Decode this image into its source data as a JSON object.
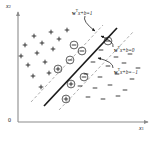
{
  "figure": {
    "background_color": "#ffffff",
    "ink_color": "#1a1a1a",
    "dashed_color": "#9a9a9a",
    "axis_color": "#8c8c8c"
  },
  "axes": {
    "x_label": "x",
    "x_subscript": "1",
    "y_label": "x",
    "y_subscript": "2",
    "origin_label": "0"
  },
  "annotations": [
    {
      "id": "margin-upper",
      "text_prefix": "w",
      "text_sup": "T",
      "text_suffix": "x+b=1",
      "x": 72,
      "y": 10
    },
    {
      "id": "hyperplane",
      "text_prefix": "w",
      "text_sup": "T",
      "text_suffix": "x+b=0",
      "x": 114,
      "y": 47
    },
    {
      "id": "margin-lower",
      "text_prefix": "w",
      "text_sup": "T",
      "text_suffix": "x+b=−1",
      "x": 114,
      "y": 69
    }
  ],
  "chart_data": {
    "type": "scatter",
    "xlabel": "x1",
    "ylabel": "x2",
    "xlim": [
      0,
      165
    ],
    "ylim": [
      0,
      141
    ],
    "grid": false,
    "legend": null,
    "lines": [
      {
        "name": "decision-boundary",
        "equation": "wTx+b=0",
        "style": "solid",
        "x1": 44,
        "y1": 106,
        "x2": 117,
        "y2": 28
      },
      {
        "name": "upper-margin",
        "equation": "wTx+b=1",
        "style": "dashed",
        "x1": 59,
        "y1": 110,
        "x2": 134,
        "y2": 31
      },
      {
        "name": "lower-margin",
        "equation": "wTx+b=-1",
        "style": "dashed",
        "x1": 31,
        "y1": 102,
        "x2": 103,
        "y2": 25
      }
    ],
    "series": [
      {
        "name": "positive-class",
        "marker": "plus",
        "points": [
          {
            "x": 34,
            "y": 36,
            "support": false
          },
          {
            "x": 51,
            "y": 32,
            "support": false
          },
          {
            "x": 67,
            "y": 30,
            "support": false
          },
          {
            "x": 25,
            "y": 45,
            "support": false
          },
          {
            "x": 42,
            "y": 43,
            "support": false
          },
          {
            "x": 59,
            "y": 39,
            "support": false
          },
          {
            "x": 21,
            "y": 56,
            "support": false
          },
          {
            "x": 37,
            "y": 53,
            "support": false
          },
          {
            "x": 53,
            "y": 49,
            "support": false
          },
          {
            "x": 28,
            "y": 65,
            "support": false
          },
          {
            "x": 45,
            "y": 62,
            "support": false
          },
          {
            "x": 33,
            "y": 76,
            "support": false
          },
          {
            "x": 49,
            "y": 73,
            "support": false
          },
          {
            "x": 41,
            "y": 87,
            "support": false
          },
          {
            "x": 58,
            "y": 69,
            "support": true
          },
          {
            "x": 71,
            "y": 84,
            "support": true
          },
          {
            "x": 66,
            "y": 99,
            "support": true
          }
        ]
      },
      {
        "name": "negative-class",
        "marker": "minus",
        "points": [
          {
            "x": 101,
            "y": 50,
            "support": false
          },
          {
            "x": 116,
            "y": 57,
            "support": false
          },
          {
            "x": 130,
            "y": 54,
            "support": false
          },
          {
            "x": 93,
            "y": 62,
            "support": false
          },
          {
            "x": 108,
            "y": 66,
            "support": false
          },
          {
            "x": 124,
            "y": 63,
            "support": false
          },
          {
            "x": 138,
            "y": 68,
            "support": false
          },
          {
            "x": 86,
            "y": 74,
            "support": false
          },
          {
            "x": 100,
            "y": 77,
            "support": false
          },
          {
            "x": 117,
            "y": 74,
            "support": false
          },
          {
            "x": 132,
            "y": 79,
            "support": false
          },
          {
            "x": 80,
            "y": 86,
            "support": false
          },
          {
            "x": 95,
            "y": 88,
            "support": false
          },
          {
            "x": 110,
            "y": 85,
            "support": false
          },
          {
            "x": 125,
            "y": 90,
            "support": false
          },
          {
            "x": 88,
            "y": 97,
            "support": false
          },
          {
            "x": 103,
            "y": 99,
            "support": false
          },
          {
            "x": 118,
            "y": 96,
            "support": false
          },
          {
            "x": 74,
            "y": 45,
            "support": true
          },
          {
            "x": 82,
            "y": 51,
            "support": true
          },
          {
            "x": 70,
            "y": 60,
            "support": true
          },
          {
            "x": 84,
            "y": 77,
            "support": true
          },
          {
            "x": 108,
            "y": 41,
            "support": true
          }
        ]
      }
    ],
    "leader_lines": [
      {
        "name": "upper-margin-leader",
        "from": [
          85,
          16
        ],
        "to": [
          95,
          31
        ]
      },
      {
        "name": "hyperplane-leader",
        "from": [
          113,
          47
        ],
        "to": [
          101,
          36
        ]
      },
      {
        "name": "lower-margin-leader",
        "from": [
          113,
          68
        ],
        "to": [
          98,
          58
        ]
      }
    ]
  }
}
